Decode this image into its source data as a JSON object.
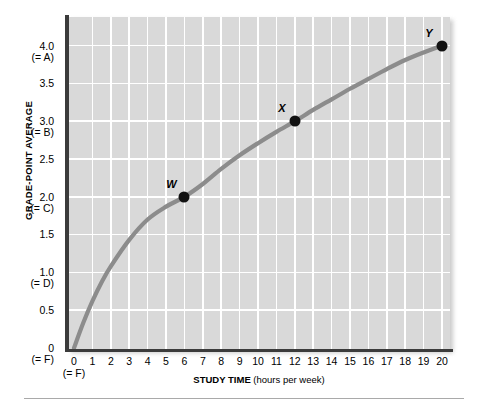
{
  "chart_data": {
    "type": "line",
    "title": "",
    "xlabel": "STUDY TIME",
    "xlabel_units": "(hours per week)",
    "ylabel": "GRADE-POINT AVERAGE",
    "xlim": [
      0,
      20
    ],
    "ylim": [
      0,
      4.3
    ],
    "grid": true,
    "legend": "none",
    "x_tick_labels": [
      "0",
      "1",
      "2",
      "3",
      "4",
      "5",
      "6",
      "7",
      "8",
      "9",
      "10",
      "11",
      "12",
      "13",
      "14",
      "15",
      "16",
      "17",
      "18",
      "19",
      "20"
    ],
    "x_tick_values": [
      0,
      1,
      2,
      3,
      4,
      5,
      6,
      7,
      8,
      9,
      10,
      11,
      12,
      13,
      14,
      15,
      16,
      17,
      18,
      19,
      20
    ],
    "x_tick_sublabels": [
      "(= F)",
      "",
      "",
      "",
      "",
      "",
      "",
      "",
      "",
      "",
      "",
      "",
      "",
      "",
      "",
      "",
      "",
      "",
      "",
      "",
      ""
    ],
    "y_tick_labels": [
      "0",
      "0.5",
      "1.0",
      "1.5",
      "2.0",
      "2.5",
      "3.0",
      "3.5",
      "4.0"
    ],
    "y_tick_values": [
      0,
      0.5,
      1.0,
      1.5,
      2.0,
      2.5,
      3.0,
      3.5,
      4.0
    ],
    "y_tick_sublabels": [
      "(= F)",
      "",
      "(= D)",
      "",
      "(= C)",
      "",
      "(= B)",
      "",
      "(= A)"
    ],
    "series": [
      {
        "name": "grade-point average vs study time",
        "color": "#8c8c8c",
        "points": [
          {
            "x": 0,
            "y": 0
          },
          {
            "x": 0.5,
            "y": 0.33
          },
          {
            "x": 1,
            "y": 0.62
          },
          {
            "x": 1.5,
            "y": 0.87
          },
          {
            "x": 2,
            "y": 1.08
          },
          {
            "x": 3,
            "y": 1.43
          },
          {
            "x": 4,
            "y": 1.7
          },
          {
            "x": 5,
            "y": 1.87
          },
          {
            "x": 6,
            "y": 2.0
          },
          {
            "x": 7,
            "y": 2.17
          },
          {
            "x": 8,
            "y": 2.37
          },
          {
            "x": 9,
            "y": 2.55
          },
          {
            "x": 10,
            "y": 2.71
          },
          {
            "x": 11,
            "y": 2.86
          },
          {
            "x": 12,
            "y": 3.0
          },
          {
            "x": 13,
            "y": 3.15
          },
          {
            "x": 14,
            "y": 3.29
          },
          {
            "x": 15,
            "y": 3.43
          },
          {
            "x": 16,
            "y": 3.56
          },
          {
            "x": 17,
            "y": 3.69
          },
          {
            "x": 18,
            "y": 3.81
          },
          {
            "x": 19,
            "y": 3.91
          },
          {
            "x": 20,
            "y": 4.0
          }
        ]
      }
    ],
    "annotated_points": [
      {
        "label": "W",
        "x": 6,
        "y": 2.0
      },
      {
        "label": "X",
        "x": 12,
        "y": 3.0
      },
      {
        "label": "Y",
        "x": 20,
        "y": 4.0
      }
    ],
    "colors": {
      "plot_background": "#d9d9d9",
      "gridline": "#ffffff",
      "axis": "#3b3b3b",
      "curve": "#8c8c8c",
      "datapoint": "#111111",
      "page_background": "#ffffff",
      "rule": "#a9a9a9"
    }
  }
}
